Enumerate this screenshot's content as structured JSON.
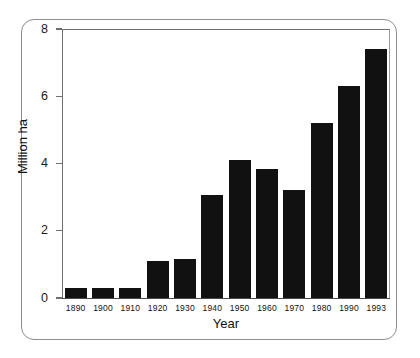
{
  "chart_data": {
    "type": "bar",
    "title": "",
    "xlabel": "Year",
    "ylabel": "Million ha",
    "categories": [
      "1890",
      "1900",
      "1910",
      "1920",
      "1930",
      "1940",
      "1950",
      "1960",
      "1970",
      "1980",
      "1990",
      "1993"
    ],
    "values": [
      0.3,
      0.3,
      0.3,
      1.1,
      1.15,
      3.05,
      4.1,
      3.85,
      3.2,
      5.2,
      6.3,
      7.4
    ],
    "ylim": [
      0,
      8
    ],
    "yticks": [
      0,
      2,
      4,
      6,
      8
    ],
    "ytick_labels": [
      "0",
      "2",
      "4",
      "6",
      "8"
    ],
    "grid": false,
    "legend": null,
    "bar_color": "#111111",
    "axis_color": "#6f6f6f",
    "frame_color": "#8d8d8d",
    "background": "#ffffff"
  }
}
